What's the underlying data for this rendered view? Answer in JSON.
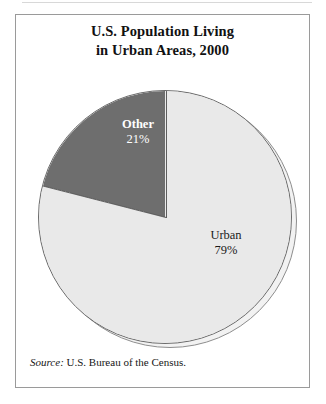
{
  "figure": {
    "title_line1": "U.S. Population Living",
    "title_line2": "in Urban Areas, 2000",
    "source_label": "Source:",
    "source_text": " U.S. Bureau of the Census."
  },
  "chart_data": {
    "type": "pie",
    "title": "U.S. Population Living in Urban Areas, 2000",
    "categories": [
      "Urban",
      "Other"
    ],
    "values": [
      79,
      21
    ],
    "value_labels": [
      "79%",
      "21%"
    ],
    "unit": "percent",
    "start_angle_deg": 0,
    "direction": "counter-clockwise-for-other",
    "slices": [
      {
        "label": "Urban",
        "value": 79,
        "value_label": "79%",
        "color": "#e9e9e9",
        "label_color": "#1a1a1a",
        "sweep_deg": 284.4
      },
      {
        "label": "Other",
        "value": 21,
        "value_label": "21%",
        "color": "#6e6e6e",
        "label_color": "#ffffff",
        "sweep_deg": 75.6
      }
    ],
    "legend": "none",
    "grid": false,
    "xlabel": "",
    "ylabel": ""
  },
  "style": {
    "frame_border": "#9a9a9a",
    "page_background": "#ffffff",
    "urban_color": "#e9e9e9",
    "other_color": "#6e6e6e",
    "outline_color": "#6b6b6b",
    "shadow_color": "#f2f2f2"
  }
}
